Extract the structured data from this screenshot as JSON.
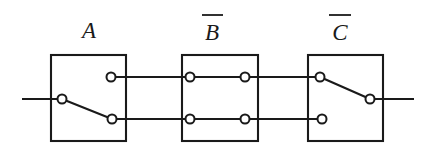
{
  "diagram": {
    "type": "switching-circuit",
    "canvas": {
      "width": 433,
      "height": 148
    },
    "stroke_color": "#1a1a1a",
    "background_color": "#ffffff",
    "node_fill_color": "#ffffff",
    "labels": [
      {
        "key": "a",
        "text": "A",
        "overbar": false,
        "x": 89,
        "y": 38,
        "bar_x1": 78,
        "bar_x2": 100,
        "bar_y": 14
      },
      {
        "key": "b",
        "text": "B",
        "overbar": true,
        "x": 212,
        "y": 40,
        "bar_x1": 202,
        "bar_x2": 223,
        "bar_y": 15
      },
      {
        "key": "c",
        "text": "C",
        "overbar": true,
        "x": 340,
        "y": 40,
        "bar_x1": 329,
        "bar_x2": 351,
        "bar_y": 15
      }
    ],
    "boxes": [
      {
        "key": "box-a",
        "label": "A",
        "x": 51,
        "y": 55,
        "width": 75,
        "height": 86
      },
      {
        "key": "box-b",
        "label": "B",
        "x": 182,
        "y": 55,
        "width": 76,
        "height": 86
      },
      {
        "key": "box-c",
        "label": "C",
        "x": 308,
        "y": 55,
        "width": 75,
        "height": 86
      }
    ],
    "rails": {
      "upper_y": 77,
      "lower_y": 119,
      "input_y": 99,
      "output_y": 99
    },
    "contacts": [
      {
        "key": "a-pivot",
        "box": "A",
        "x": 62,
        "y": 99,
        "r": 4.5
      },
      {
        "key": "a-upper",
        "box": "A",
        "x": 111,
        "y": 77,
        "r": 4.5
      },
      {
        "key": "a-lower",
        "box": "A",
        "x": 112,
        "y": 119,
        "r": 4.5
      },
      {
        "key": "b-upper-left",
        "box": "B",
        "x": 190,
        "y": 77,
        "r": 4.5
      },
      {
        "key": "b-upper-right",
        "box": "B",
        "x": 245,
        "y": 77,
        "r": 4.5
      },
      {
        "key": "b-lower-left",
        "box": "B",
        "x": 190,
        "y": 119,
        "r": 4.5
      },
      {
        "key": "b-lower-right",
        "box": "B",
        "x": 245,
        "y": 119,
        "r": 4.5
      },
      {
        "key": "c-pivot",
        "box": "C",
        "x": 320,
        "y": 77,
        "r": 4.5
      },
      {
        "key": "c-lower",
        "box": "C",
        "x": 322,
        "y": 119,
        "r": 4.5
      },
      {
        "key": "c-output",
        "box": "C",
        "x": 370,
        "y": 99,
        "r": 4.5
      }
    ],
    "wires": [
      {
        "key": "input-lead",
        "x1": 22,
        "y1": 99,
        "x2": 62,
        "y2": 99
      },
      {
        "key": "a-upper-stub",
        "x1": 111,
        "y1": 77,
        "x2": 182,
        "y2": 77
      },
      {
        "key": "a-lower-stub",
        "x1": 112,
        "y1": 119,
        "x2": 182,
        "y2": 119
      },
      {
        "key": "b-upper-bridge",
        "x1": 190,
        "y1": 77,
        "x2": 245,
        "y2": 77
      },
      {
        "key": "b-lower-bridge",
        "x1": 190,
        "y1": 119,
        "x2": 245,
        "y2": 119
      },
      {
        "key": "b-to-c-upper",
        "x1": 245,
        "y1": 77,
        "x2": 320,
        "y2": 77
      },
      {
        "key": "b-to-c-lower",
        "x1": 245,
        "y1": 119,
        "x2": 322,
        "y2": 119
      },
      {
        "key": "output-lead",
        "x1": 370,
        "y1": 99,
        "x2": 414,
        "y2": 99
      }
    ],
    "blades": [
      {
        "key": "blade-a",
        "box": "A",
        "x1": 62,
        "y1": 99,
        "x2": 112,
        "y2": 119,
        "state": "closed-lower"
      },
      {
        "key": "blade-c",
        "box": "C",
        "x1": 320,
        "y1": 77,
        "x2": 370,
        "y2": 99,
        "state": "closed-output"
      }
    ]
  }
}
